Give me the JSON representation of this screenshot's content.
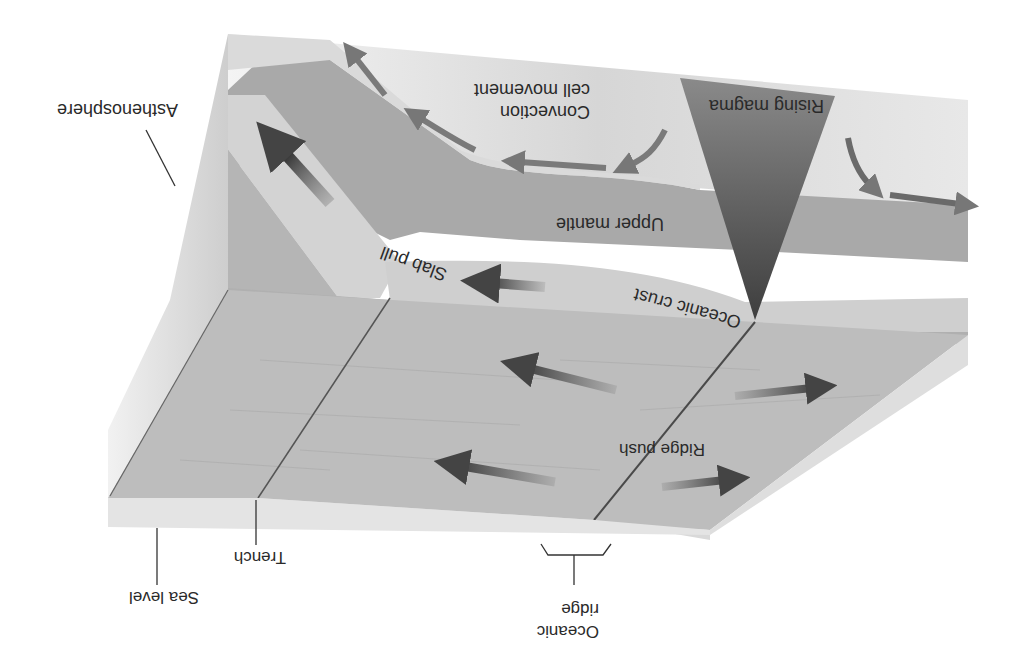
{
  "figure": {
    "orientation": "rotated 180 degrees",
    "colors": {
      "background": "#ffffff",
      "sea_floor": "#bcbcbc",
      "oceanic_crust": "#c9c9c9",
      "upper_mantle": "#a4a4a4",
      "asthenosphere": "#dcdcdc",
      "edge_face": "#e6e6e6",
      "magma_dark": "#4e4e4e",
      "arrow": "#555555",
      "text": "#2a2a2a"
    }
  },
  "labels": {
    "asthenosphere": "Asthenosphere",
    "convection_line1": "Convection",
    "convection_line2": "cell movement",
    "rising_magma": "Rising magma",
    "upper_mantle": "Upper mantle",
    "slab_pull": "Slab pull",
    "oceanic_crust": "Oceanic crust",
    "ridge_push": "Ridge push",
    "trench": "Trench",
    "sea_level": "Sea level",
    "oceanic_ridge_line1": "Oceanic",
    "oceanic_ridge_line2": "ridge"
  }
}
